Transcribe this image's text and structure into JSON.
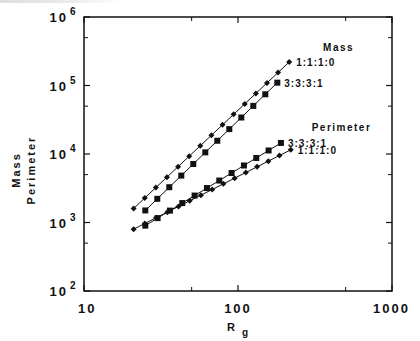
{
  "chart_data": {
    "type": "scatter",
    "title": "",
    "xlabel": "R",
    "xlabel_subscript": "g",
    "ylabel_lines": [
      "Mass",
      "Perimeter"
    ],
    "xscale": "log",
    "yscale": "log",
    "xlim": [
      10,
      1000
    ],
    "ylim": [
      100,
      1000000
    ],
    "x_ticks": [
      {
        "value": 10,
        "label": "10"
      },
      {
        "value": 100,
        "label": "100"
      },
      {
        "value": 1000,
        "label": "1000"
      }
    ],
    "x_minor_ticks": [
      50,
      500
    ],
    "y_ticks": [
      {
        "value": 100,
        "base": "10",
        "exp": "2"
      },
      {
        "value": 1000,
        "base": "10",
        "exp": "3"
      },
      {
        "value": 10000,
        "base": "10",
        "exp": "4"
      },
      {
        "value": 100000,
        "base": "10",
        "exp": "5"
      },
      {
        "value": 1000000,
        "base": "10",
        "exp": "6"
      }
    ],
    "y_minor_ticks": [
      500,
      5000,
      50000,
      500000
    ],
    "grid": false,
    "legend": "inline labels at line ends",
    "groups": [
      {
        "label": "Mass",
        "anchor": {
          "x": 450,
          "y": 320000
        }
      },
      {
        "label": "Perimeter",
        "anchor": {
          "x": 470,
          "y": 22000
        }
      }
    ],
    "series": [
      {
        "name": "Mass 1:1:1:0",
        "group": "Mass",
        "label": "1:1:1:0",
        "marker": "diamond",
        "x_start": 21,
        "x_end": 215,
        "y_start": 1600,
        "y_end": 220000,
        "n_points": 15
      },
      {
        "name": "Mass 3:3:3:1",
        "group": "Mass",
        "label": "3:3:3:1",
        "marker": "square",
        "x_start": 25,
        "x_end": 180,
        "y_start": 1500,
        "y_end": 110000,
        "n_points": 12
      },
      {
        "name": "Perimeter 3:3:3:1",
        "group": "Perimeter",
        "label": "3:3:3:1",
        "marker": "square",
        "x_start": 25,
        "x_end": 190,
        "y_start": 900,
        "y_end": 14500,
        "n_points": 12
      },
      {
        "name": "Perimeter 1:1:1:0",
        "group": "Perimeter",
        "label": "1:1:1:0",
        "marker": "diamond",
        "x_start": 21,
        "x_end": 220,
        "y_start": 800,
        "y_end": 11500,
        "n_points": 15
      }
    ]
  },
  "layout": {
    "plot": {
      "left": 84,
      "top": 17,
      "right": 392,
      "bottom": 291
    },
    "line_color": "#111111"
  }
}
